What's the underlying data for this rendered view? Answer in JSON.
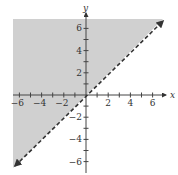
{
  "chart_data": {
    "type": "area",
    "title": "",
    "inequality": "y > x",
    "boundary": {
      "equation": "y = x",
      "slope": 1,
      "intercept": 0,
      "style": "dashed",
      "arrows": "both ends"
    },
    "shaded_region": "above the line",
    "xlabel": "x",
    "ylabel": "y",
    "xlim": [
      -6.7,
      7.3
    ],
    "ylim": [
      -7.0,
      7.6
    ],
    "x_tick_labels": [
      "-6",
      "-4",
      "-2",
      "2",
      "4",
      "6"
    ],
    "y_tick_labels": [
      "6",
      "4",
      "2",
      "-2",
      "-4",
      "-6"
    ],
    "x_ticks": [
      -6,
      -5,
      -4,
      -3,
      -2,
      -1,
      1,
      2,
      3,
      4,
      5,
      6
    ],
    "y_ticks": [
      -6,
      -5,
      -4,
      -3,
      -2,
      -1,
      1,
      2,
      3,
      4,
      5,
      6
    ],
    "grid": false,
    "legend": null,
    "colors": {
      "shade": "#cfcfcf",
      "line": "#333333",
      "axis": "#444444"
    }
  }
}
